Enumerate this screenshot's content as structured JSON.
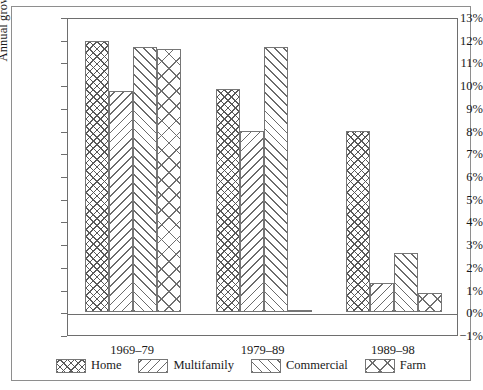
{
  "chart_data": {
    "type": "bar",
    "title": "",
    "xlabel": "",
    "ylabel": "Annual growth rate",
    "categories": [
      "1969–79",
      "1979–89",
      "1989–98"
    ],
    "series": [
      {
        "name": "Home",
        "pattern": "cross-hatch",
        "values": [
          11.95,
          9.85,
          8.0
        ]
      },
      {
        "name": "Multifamily",
        "pattern": "diagonal-back",
        "values": [
          9.75,
          8.0,
          1.3
        ]
      },
      {
        "name": "Commercial",
        "pattern": "diagonal-forward",
        "values": [
          11.7,
          11.7,
          2.6
        ]
      },
      {
        "name": "Farm",
        "pattern": "large-x",
        "values": [
          11.6,
          0.1,
          0.85
        ]
      }
    ],
    "ylim": [
      -1,
      13
    ],
    "ytick_values": [
      -1,
      0,
      1,
      2,
      3,
      4,
      5,
      6,
      7,
      8,
      9,
      10,
      11,
      12,
      13
    ],
    "ytick_labels": [
      "−1%",
      "0%",
      "1%",
      "2%",
      "3%",
      "4%",
      "5%",
      "6%",
      "7%",
      "8%",
      "9%",
      "10%",
      "11%",
      "12%",
      "13%"
    ],
    "grid": false,
    "legend_position": "bottom",
    "colors": {
      "background": "#ffffff",
      "axis": "#6e6e6e",
      "frame": "#8e8e8e",
      "hatch": "#666666",
      "text": "#1a1a1a"
    }
  }
}
